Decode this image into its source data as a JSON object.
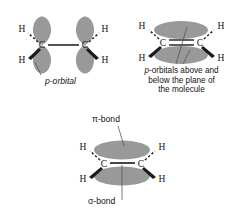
{
  "figure": {
    "background_color": "#ffffff",
    "orbital_fill": "#999999",
    "bond_color": "#1a1a1a"
  },
  "panels": [
    {
      "id": "p-orbital",
      "caption": "p-orbital",
      "caption_style": "italic",
      "atoms": [
        {
          "symbol": "C",
          "position": "left-center"
        },
        {
          "symbol": "C",
          "position": "right-center"
        },
        {
          "symbol": "H",
          "position": "upper-left",
          "bond": "dashed"
        },
        {
          "symbol": "H",
          "position": "lower-left",
          "bond": "wedge"
        },
        {
          "symbol": "H",
          "position": "upper-right",
          "bond": "dashed"
        },
        {
          "symbol": "H",
          "position": "lower-right",
          "bond": "wedge"
        }
      ],
      "carbon_carbon_bond": "single-line",
      "orbital_shape": "teardrop-lobes",
      "orbital_count": 4,
      "leader_line": true
    },
    {
      "id": "p-orbitals-plane",
      "caption_line_1": "p-orbitals above and",
      "caption_line_2": "below the plane of",
      "caption_line_3": "the molecule",
      "caption_italic_token": "p",
      "atoms": [
        {
          "symbol": "C",
          "position": "left-center"
        },
        {
          "symbol": "C",
          "position": "right-center"
        },
        {
          "symbol": "H",
          "position": "upper-left",
          "bond": "dashed"
        },
        {
          "symbol": "H",
          "position": "lower-left",
          "bond": "wedge"
        },
        {
          "symbol": "H",
          "position": "upper-right",
          "bond": "dashed"
        },
        {
          "symbol": "H",
          "position": "lower-right",
          "bond": "wedge"
        }
      ],
      "carbon_carbon_bond": "double-line",
      "orbital_shape": "horizontal-ellipses",
      "orbital_count": 2,
      "leader_lines": 2
    },
    {
      "id": "pi-sigma",
      "label_top": "π-bond",
      "label_bottom": "σ-bond",
      "atoms": [
        {
          "symbol": "C",
          "position": "left-center"
        },
        {
          "symbol": "C",
          "position": "right-center"
        },
        {
          "symbol": "H",
          "position": "upper-left",
          "bond": "dashed"
        },
        {
          "symbol": "H",
          "position": "lower-left",
          "bond": "wedge"
        },
        {
          "symbol": "H",
          "position": "upper-right",
          "bond": "dashed"
        },
        {
          "symbol": "H",
          "position": "lower-right",
          "bond": "wedge"
        }
      ],
      "carbon_carbon_bond": "single-line",
      "orbital_shape": "horizontal-ellipses",
      "orbital_count": 2,
      "leader_lines": 2
    }
  ]
}
